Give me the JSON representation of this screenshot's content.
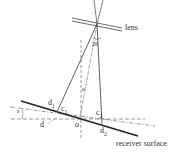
{
  "diagram": {
    "labels": {
      "lens": "lens",
      "two_theta": "2θ",
      "e": "e",
      "d1": "d",
      "d1_sub": "1",
      "c1": "c",
      "c1_sub": "1",
      "epsilon": "ε",
      "d": "d",
      "o": "o",
      "c2": "c",
      "c2_sub": "2",
      "d2": "d",
      "d2_sub": "2",
      "receiver": "receiver surface"
    },
    "colors": {
      "line": "#333333",
      "dashed": "#555555"
    }
  }
}
